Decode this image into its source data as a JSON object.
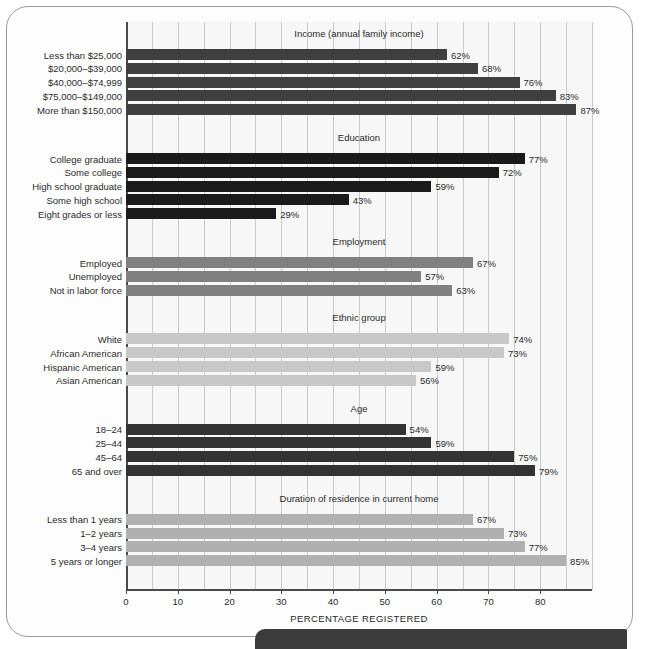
{
  "figure": {
    "axis_caption": "PERCENTAGE REGISTERED"
  },
  "chart_data": {
    "type": "bar",
    "orientation": "horizontal",
    "title": "",
    "xlabel": "PERCENTAGE REGISTERED",
    "ylabel": "",
    "xlim": [
      0,
      90
    ],
    "xticks": [
      0,
      10,
      20,
      30,
      40,
      50,
      60,
      70,
      80
    ],
    "xticklabels": [
      "0",
      "10",
      "20",
      "30",
      "40",
      "50",
      "60",
      "70",
      "80"
    ],
    "minor_tick_step": 5,
    "grid": "vertical minor gridlines every 5 units",
    "value_suffix": "%",
    "legend": "none",
    "groups": [
      {
        "name": "Income (annual family income)",
        "color": "#3f3f3f",
        "categories": [
          "Less than $25,000",
          "$20,000–$39,000",
          "$40,000–$74,999",
          "$75,000–$149,000",
          "More than $150,000"
        ],
        "values": [
          62,
          68,
          76,
          83,
          87
        ],
        "labels": [
          "62%",
          "68%",
          "76%",
          "83%",
          "87%"
        ]
      },
      {
        "name": "Education",
        "color": "#1a1a1a",
        "categories": [
          "College graduate",
          "Some college",
          "High school graduate",
          "Some high school",
          "Eight grades or less"
        ],
        "values": [
          77,
          72,
          59,
          43,
          29
        ],
        "labels": [
          "77%",
          "72%",
          "59%",
          "43%",
          "29%"
        ]
      },
      {
        "name": "Employment",
        "color": "#808080",
        "categories": [
          "Employed",
          "Unemployed",
          "Not in labor force"
        ],
        "values": [
          67,
          57,
          63
        ],
        "labels": [
          "67%",
          "57%",
          "63%"
        ]
      },
      {
        "name": "Ethnic group",
        "color": "#c8c8c8",
        "categories": [
          "White",
          "African American",
          "Hispanic American",
          "Asian American"
        ],
        "values": [
          74,
          73,
          59,
          56
        ],
        "labels": [
          "74%",
          "73%",
          "59%",
          "56%"
        ]
      },
      {
        "name": "Age",
        "color": "#333333",
        "categories": [
          "18–24",
          "25–44",
          "45–64",
          "65 and over"
        ],
        "values": [
          54,
          59,
          75,
          79
        ],
        "labels": [
          "54%",
          "59%",
          "75%",
          "79%"
        ]
      },
      {
        "name": "Duration of residence in current home",
        "color": "#b0b0b0",
        "categories": [
          "Less than 1 years",
          "1–2 years",
          "3–4 years",
          "5 years or longer"
        ],
        "values": [
          67,
          73,
          77,
          85
        ],
        "labels": [
          "67%",
          "73%",
          "77%",
          "85%"
        ]
      }
    ]
  }
}
